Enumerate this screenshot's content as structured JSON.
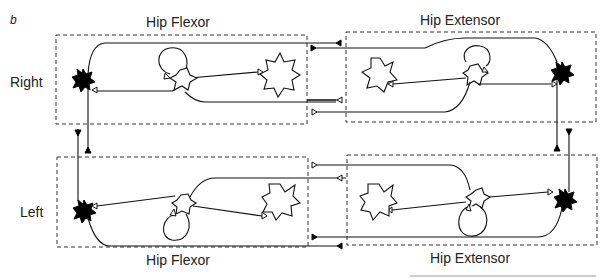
{
  "figure": {
    "panel_letter": "b",
    "sides": {
      "right": "Right",
      "left": "Left"
    },
    "modules": [
      {
        "id": "right-flexor",
        "title": "Hip Flexor",
        "side": "Right",
        "title_position": "top"
      },
      {
        "id": "right-extensor",
        "title": "Hip Extensor",
        "side": "Right",
        "title_position": "top"
      },
      {
        "id": "left-flexor",
        "title": "Hip Flexor",
        "side": "Left",
        "title_position": "bottom"
      },
      {
        "id": "left-extensor",
        "title": "Hip Extensor",
        "side": "Left",
        "title_position": "bottom"
      }
    ],
    "legend_semantics": {
      "filled_star": "motor/rhythm neuron (filled)",
      "open_star": "interneuron (open)",
      "open_triangle": "excitatory synapse",
      "filled_triangle": "inhibitory synapse"
    },
    "colors": {
      "ink": "#111111",
      "box_dash": "#333333",
      "background": "#ffffff"
    }
  }
}
